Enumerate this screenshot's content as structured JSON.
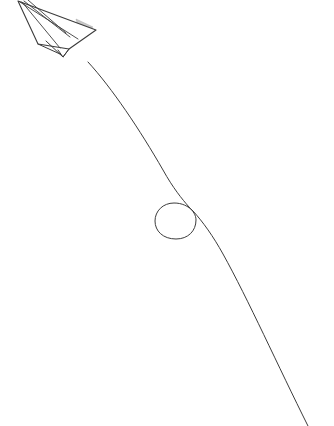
{
  "artwork": {
    "title": "Paper airplane with looping flight trail",
    "medium": "pencil line drawing",
    "background_color": "#ffffff",
    "ink_color": "#3c3c3c",
    "shade_color": "#9a9a9a",
    "canvas": {
      "width": 334,
      "height": 426
    },
    "alt_text": "A hand-drawn paper airplane in the upper left corner trailing a long curved line that descends, makes a small loop, and sweeps off the bottom right edge."
  },
  "airplane": {
    "label": "paper-airplane",
    "heading": "up-left",
    "nose_point": {
      "x": 18,
      "y": 1
    },
    "tail_point": {
      "x": 69,
      "y": 50
    },
    "wing_tip_right": {
      "x": 96,
      "y": 30
    },
    "wing_tip_left": {
      "x": 38,
      "y": 44
    },
    "body_outline": "M 18 1 L 96 30 L 69 49 L 38 44 Z",
    "fold_lines": [
      "M 20 2 L 78 39",
      "M 24 1 L 70 37",
      "M 28 0 L 66 33",
      "M 22 2 L 60 48"
    ],
    "shaded_patches": [
      {
        "name": "right-wing-shadow",
        "path": "M 76 19 L 93 27 L 80 34 Z"
      },
      {
        "name": "body-shadow",
        "path": "M 52 28 L 72 38 L 56 44 Z"
      },
      {
        "name": "keel-shadow",
        "path": "M 60 34 L 70 42 L 62 47 Z"
      }
    ]
  },
  "trail": {
    "label": "flight-trail",
    "stroke_width": 1,
    "start_point": {
      "x": 88,
      "y": 62
    },
    "end_point": {
      "x": 308,
      "y": 426
    },
    "loop": {
      "center": {
        "x": 175,
        "y": 221
      },
      "radius_x": 19,
      "radius_y": 18,
      "crossing_point": {
        "x": 189,
        "y": 208
      },
      "direction": "counter-clockwise"
    },
    "path": "M 88 62 C 112 88 140 130 163 170 C 173 188 182 199 189 207 C 193 211 196 215 196 220 C 196 231 188 239 176 239 C 163 239 155 231 155 221 C 155 211 163 203 174 203 C 182 203 188 206 193 211 C 203 222 213 236 223 254 C 248 299 278 366 308 426"
  }
}
